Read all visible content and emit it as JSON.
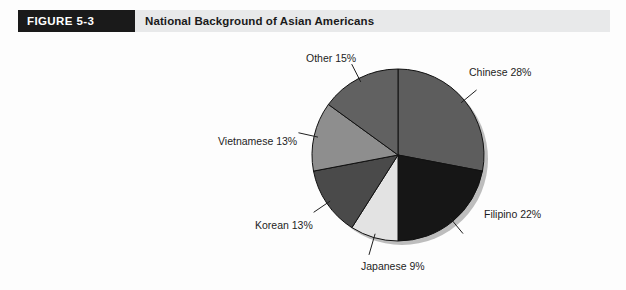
{
  "figure": {
    "tag": "FIGURE  5-3",
    "title": "National Background of Asian Americans"
  },
  "colors": {
    "header_band": "#e8e9ea",
    "tag_background": "#1a1a1a",
    "tag_text": "#ffffff",
    "title_text": "#1a1a1a",
    "page_background": "#fdfdfd",
    "slice_outline": "#111111",
    "leader_line": "#222222",
    "shadow": "#b9b9b9"
  },
  "chart_data": {
    "type": "pie",
    "title": "National Background of Asian Americans",
    "xlabel": "",
    "ylabel": "",
    "legend": "none",
    "grid": false,
    "start_angle_deg": 0,
    "direction": "clockwise",
    "categories": [
      "Chinese",
      "Filipino",
      "Japanese",
      "Korean",
      "Vietnamese",
      "Other"
    ],
    "values": [
      28,
      22,
      9,
      13,
      13,
      15
    ],
    "unit": "%",
    "slices": [
      {
        "name": "Chinese",
        "value": 28,
        "label": "Chinese 28%",
        "color": "#5d5d5d"
      },
      {
        "name": "Filipino",
        "value": 22,
        "label": "Filipino 22%",
        "color": "#161616"
      },
      {
        "name": "Japanese",
        "value": 9,
        "label": "Japanese 9%",
        "color": "#e3e3e3"
      },
      {
        "name": "Korean",
        "value": 13,
        "label": "Korean 13%",
        "color": "#4a4a4a"
      },
      {
        "name": "Vietnamese",
        "value": 13,
        "label": "Vietnamese 13%",
        "color": "#8e8e8e"
      },
      {
        "name": "Other",
        "value": 15,
        "label": "Other 15%",
        "color": "#616161"
      }
    ]
  }
}
